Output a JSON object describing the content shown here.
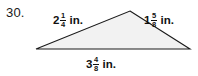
{
  "problem": {
    "number": "30."
  },
  "figure": {
    "shape_name": "triangle",
    "fill_color": "#f2f2f2",
    "stroke_color": "#1a1a1a",
    "vertices": {
      "apex": [
        130,
        11
      ],
      "bottom_left": [
        36,
        49
      ],
      "bottom_right": [
        190,
        49
      ]
    }
  },
  "labels": {
    "left_side": {
      "whole": "2",
      "numerator": "1",
      "denominator": "4",
      "unit": "in."
    },
    "right_side": {
      "whole": "1",
      "numerator": "5",
      "denominator": "8",
      "unit": "in."
    },
    "base": {
      "whole": "3",
      "numerator": "4",
      "denominator": "8",
      "unit": "in."
    }
  }
}
